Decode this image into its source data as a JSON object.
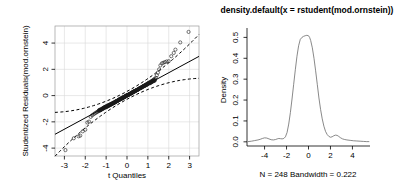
{
  "figure": {
    "background": "#ffffff",
    "panel_count": 2
  },
  "chart_data": [
    {
      "type": "scatter",
      "name": "qq-plot",
      "title": "",
      "xlabel": "t Quantiles",
      "ylabel": "Studentized Residuals(mod.ornstein)",
      "xlim": [
        -3.45,
        3.45
      ],
      "ylim": [
        -4.6,
        5.3
      ],
      "xticks": [
        -3,
        -2,
        -1,
        0,
        1,
        2,
        3
      ],
      "xticklabels": [
        "-3",
        "-2",
        "-1",
        "0",
        "1",
        "2",
        "3"
      ],
      "yticks": [
        -4,
        -2,
        0,
        2,
        4
      ],
      "yticklabels": [
        "-4",
        "-2",
        "0",
        "2",
        "4"
      ],
      "grid": true,
      "legend": "none",
      "marker": "open-circle",
      "reference_line": {
        "style": "solid",
        "intercept": 0.02,
        "slope": 0.86,
        "label": "qq-reference-line"
      },
      "confidence_envelope": {
        "style": "dashed",
        "label": "qq-confidence-envelope"
      },
      "x": [
        -2.95,
        -2.55,
        -2.32,
        -2.24,
        -2.12,
        -2.0,
        -1.9,
        -1.82,
        -1.74,
        -1.67,
        -1.6,
        -1.54,
        -1.48,
        -1.43,
        -1.38,
        -1.33,
        -1.28,
        -1.24,
        -1.2,
        -1.16,
        -1.12,
        -1.08,
        -1.04,
        -1.0,
        -0.97,
        -0.93,
        -0.9,
        -0.87,
        -0.84,
        -0.81,
        -0.78,
        -0.75,
        -0.72,
        -0.69,
        -0.66,
        -0.63,
        -0.61,
        -0.58,
        -0.55,
        -0.53,
        -0.5,
        -0.48,
        -0.45,
        -0.43,
        -0.4,
        -0.38,
        -0.35,
        -0.33,
        -0.31,
        -0.28,
        -0.26,
        -0.24,
        -0.21,
        -0.19,
        -0.17,
        -0.15,
        -0.12,
        -0.1,
        -0.08,
        -0.06,
        -0.04,
        -0.01,
        0.01,
        0.03,
        0.05,
        0.08,
        0.1,
        0.12,
        0.14,
        0.17,
        0.19,
        0.21,
        0.24,
        0.26,
        0.28,
        0.31,
        0.33,
        0.35,
        0.38,
        0.4,
        0.43,
        0.45,
        0.48,
        0.5,
        0.53,
        0.55,
        0.58,
        0.61,
        0.63,
        0.66,
        0.69,
        0.72,
        0.75,
        0.78,
        0.81,
        0.84,
        0.87,
        0.9,
        0.93,
        0.97,
        1.0,
        1.04,
        1.08,
        1.12,
        1.16,
        1.2,
        1.24,
        1.28,
        1.33,
        1.38,
        1.43,
        1.48,
        1.54,
        1.6,
        1.67,
        1.74,
        1.82,
        1.9,
        2.0,
        2.12,
        2.24,
        2.32,
        2.55,
        2.95
      ],
      "y": [
        -4.15,
        -3.25,
        -3.1,
        -3.05,
        -2.72,
        -2.6,
        -2.05,
        -1.98,
        -1.62,
        -1.5,
        -1.42,
        -1.35,
        -1.3,
        -1.24,
        -1.2,
        -1.16,
        -1.12,
        -1.08,
        -1.04,
        -1.0,
        -0.97,
        -0.94,
        -0.91,
        -0.88,
        -0.85,
        -0.82,
        -0.8,
        -0.77,
        -0.74,
        -0.72,
        -0.69,
        -0.66,
        -0.64,
        -0.61,
        -0.59,
        -0.56,
        -0.54,
        -0.51,
        -0.49,
        -0.47,
        -0.44,
        -0.42,
        -0.4,
        -0.38,
        -0.35,
        -0.33,
        -0.31,
        -0.29,
        -0.27,
        -0.25,
        -0.23,
        -0.21,
        -0.19,
        -0.17,
        -0.15,
        -0.13,
        -0.11,
        -0.09,
        -0.07,
        -0.05,
        -0.03,
        -0.01,
        0.01,
        0.03,
        0.05,
        0.07,
        0.09,
        0.11,
        0.13,
        0.15,
        0.17,
        0.19,
        0.21,
        0.23,
        0.25,
        0.27,
        0.29,
        0.31,
        0.34,
        0.36,
        0.38,
        0.4,
        0.43,
        0.45,
        0.47,
        0.5,
        0.52,
        0.55,
        0.57,
        0.6,
        0.63,
        0.65,
        0.68,
        0.71,
        0.74,
        0.77,
        0.8,
        0.83,
        0.86,
        0.9,
        0.93,
        0.97,
        1.0,
        1.04,
        1.08,
        1.12,
        1.17,
        1.22,
        1.27,
        1.35,
        1.55,
        1.75,
        2.0,
        2.3,
        2.45,
        2.5,
        2.55,
        2.6,
        2.62,
        3.0,
        3.25,
        3.5,
        4.05,
        4.85
      ]
    },
    {
      "type": "line",
      "name": "density-plot",
      "title": "density.default(x = rstudent(mod.ornstein))",
      "xlabel": "",
      "ylabel": "Density",
      "caption": "N = 248   Bandwidth = 0.222",
      "xlim": [
        -5.6,
        5.6
      ],
      "ylim": [
        -0.02,
        0.545
      ],
      "xticks": [
        -4,
        -2,
        0,
        2,
        4
      ],
      "xticklabels": [
        "-4",
        "-2",
        "0",
        "2",
        "4"
      ],
      "yticks": [
        0.0,
        0.1,
        0.2,
        0.3,
        0.4,
        0.5
      ],
      "yticklabels": [
        "0.0",
        "0.1",
        "0.2",
        "0.3",
        "0.4",
        "0.5"
      ],
      "grid": false,
      "legend": "none",
      "n": 248,
      "bandwidth": 0.222,
      "x": [
        -5.5,
        -5.2,
        -4.9,
        -4.6,
        -4.4,
        -4.2,
        -4.0,
        -3.8,
        -3.6,
        -3.4,
        -3.2,
        -3.0,
        -2.85,
        -2.7,
        -2.55,
        -2.4,
        -2.25,
        -2.1,
        -1.95,
        -1.8,
        -1.65,
        -1.5,
        -1.35,
        -1.2,
        -1.05,
        -0.9,
        -0.75,
        -0.6,
        -0.45,
        -0.3,
        -0.15,
        0.0,
        0.1,
        0.2,
        0.35,
        0.5,
        0.65,
        0.8,
        0.95,
        1.1,
        1.25,
        1.4,
        1.55,
        1.7,
        1.85,
        2.0,
        2.15,
        2.3,
        2.45,
        2.6,
        2.75,
        2.9,
        3.1,
        3.3,
        3.5,
        3.8,
        4.1,
        4.4,
        4.7,
        5.0,
        5.3,
        5.5
      ],
      "y": [
        0.001,
        0.003,
        0.006,
        0.009,
        0.012,
        0.016,
        0.019,
        0.018,
        0.014,
        0.01,
        0.009,
        0.011,
        0.014,
        0.016,
        0.015,
        0.014,
        0.016,
        0.024,
        0.045,
        0.085,
        0.14,
        0.205,
        0.275,
        0.345,
        0.41,
        0.46,
        0.49,
        0.5,
        0.505,
        0.508,
        0.51,
        0.508,
        0.5,
        0.485,
        0.45,
        0.4,
        0.34,
        0.275,
        0.21,
        0.155,
        0.11,
        0.075,
        0.05,
        0.035,
        0.026,
        0.022,
        0.024,
        0.029,
        0.032,
        0.031,
        0.026,
        0.02,
        0.014,
        0.011,
        0.009,
        0.007,
        0.005,
        0.004,
        0.003,
        0.002,
        0.001,
        0.001
      ]
    }
  ]
}
